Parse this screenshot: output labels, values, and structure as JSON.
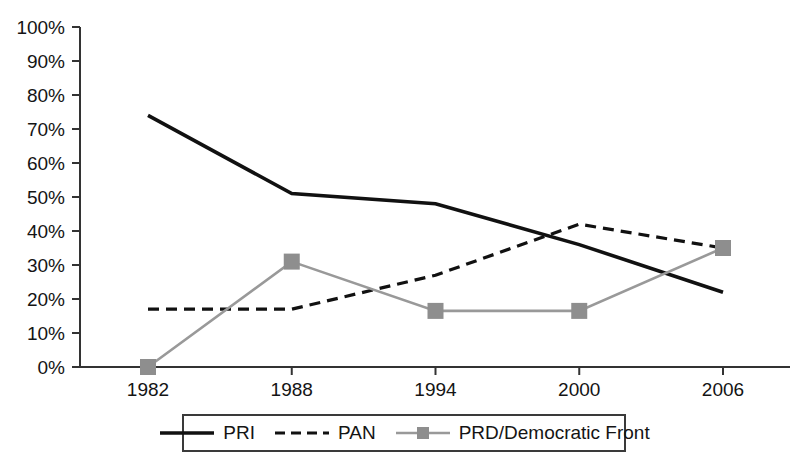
{
  "chart_data": {
    "type": "line",
    "title": "",
    "subtitle": "",
    "xlabel": "",
    "ylabel": "",
    "categories": [
      "1982",
      "1988",
      "1994",
      "2000",
      "2006"
    ],
    "x": [
      1982,
      1988,
      1994,
      2000,
      2006
    ],
    "xlim": [
      1982,
      2006
    ],
    "ylim": [
      0,
      100
    ],
    "grid": false,
    "legend_position": "bottom",
    "ytick_labels": [
      "0%",
      "10%",
      "20%",
      "30%",
      "40%",
      "50%",
      "60%",
      "70%",
      "80%",
      "90%",
      "100%"
    ],
    "ytick_values": [
      0,
      10,
      20,
      30,
      40,
      50,
      60,
      70,
      80,
      90,
      100
    ],
    "xtick_labels": [
      "1982",
      "1988",
      "1994",
      "2000",
      "2006"
    ],
    "series": [
      {
        "name": "PRI",
        "values": [
          74,
          51,
          48,
          36,
          22
        ],
        "color": "#111111",
        "style": "solid",
        "marker": "none"
      },
      {
        "name": "PAN",
        "values": [
          17,
          17,
          27,
          42,
          35
        ],
        "color": "#111111",
        "style": "dashed",
        "marker": "none"
      },
      {
        "name": "PRD/Democratic Front",
        "values": [
          0,
          31,
          16.5,
          16.5,
          35
        ],
        "color": "#999999",
        "style": "solid",
        "marker": "square"
      }
    ]
  },
  "legend": {
    "entries": [
      {
        "label": "PRI"
      },
      {
        "label": "PAN"
      },
      {
        "label": "PRD/Democratic Front"
      }
    ]
  },
  "colors": {
    "axis": "#333333",
    "pri": "#111111",
    "pan": "#111111",
    "prd": "#999999",
    "background": "#ffffff"
  }
}
